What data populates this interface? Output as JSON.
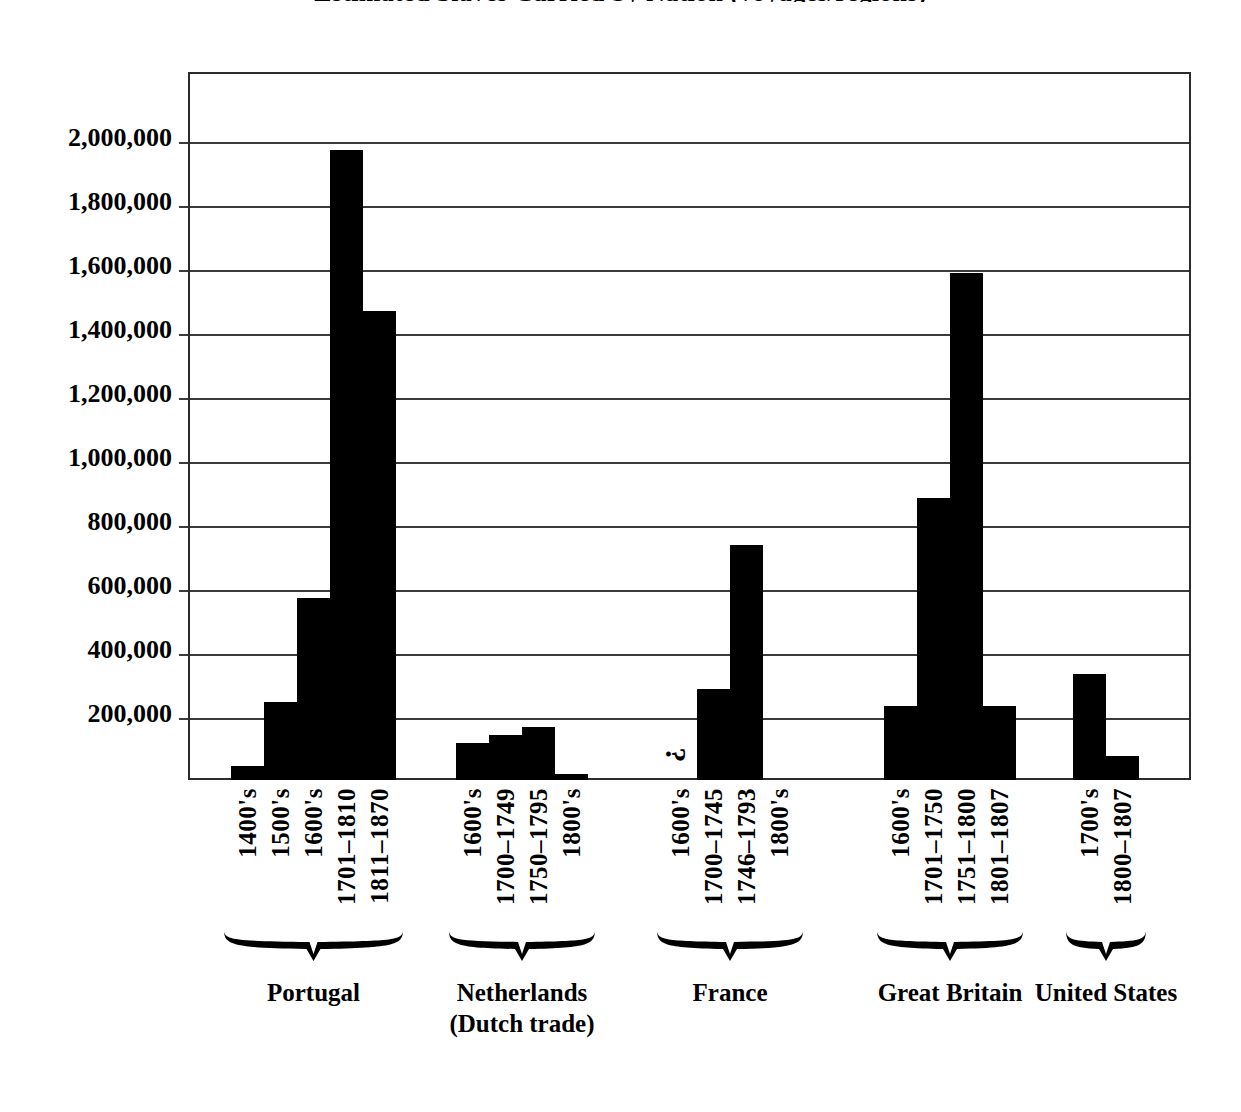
{
  "title": "Estimated Slaves Carried by Nation (voyages/regions)",
  "chart_data": {
    "type": "bar",
    "title": "Estimated Slaves Carried by Nation (voyages/regions)",
    "xlabel": "",
    "ylabel": "",
    "ylim": [
      0,
      2200000
    ],
    "grid": true,
    "legend": "none",
    "y_ticks": [
      "200,000",
      "400,000",
      "600,000",
      "800,000",
      "1,000,000",
      "1,200,000",
      "1,400,000",
      "1,600,000",
      "1,800,000",
      "2,000,000"
    ],
    "y_tick_values": [
      200000,
      400000,
      600000,
      800000,
      1000000,
      1200000,
      1400000,
      1600000,
      1800000,
      2000000
    ],
    "groups": [
      {
        "name": "Portugal",
        "categories": [
          "1400's",
          "1500's",
          "1600's",
          "1701–1810",
          "1811–1870"
        ],
        "values": [
          45000,
          245000,
          570000,
          1970000,
          1465000
        ],
        "notes": [
          "",
          "",
          "",
          "",
          ""
        ]
      },
      {
        "name": "Netherlands\n(Dutch trade)",
        "categories": [
          "1600's",
          "1700–1749",
          "1750–1795",
          "1800's"
        ],
        "values": [
          115000,
          140000,
          165000,
          20000
        ],
        "notes": [
          "",
          "",
          "",
          ""
        ]
      },
      {
        "name": "France",
        "categories": [
          "1600's",
          "1700–1745",
          "1746–1793",
          "1800's"
        ],
        "values": [
          null,
          285000,
          735000,
          0
        ],
        "notes": [
          "?",
          "",
          "",
          ""
        ]
      },
      {
        "name": "Great Britain",
        "categories": [
          "1600's",
          "1701–1750",
          "1751–1800",
          "1801–1807"
        ],
        "values": [
          230000,
          880000,
          1583000,
          230000
        ],
        "notes": [
          "",
          "",
          "",
          ""
        ]
      },
      {
        "name": "United States",
        "categories": [
          "1700's",
          "1800–1807"
        ],
        "values": [
          330000,
          75000
        ],
        "notes": [
          "",
          ""
        ]
      }
    ]
  },
  "colors": {
    "bar": "#000000",
    "axis": "#2b2b2b",
    "grid": "#3a3a3a",
    "background": "#ffffff",
    "text": "#000000"
  }
}
